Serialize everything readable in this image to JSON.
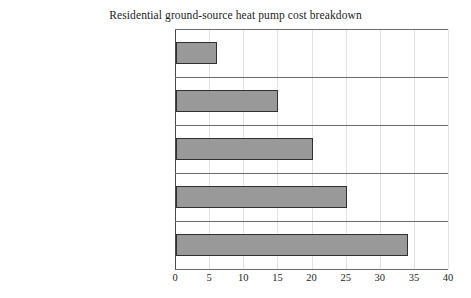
{
  "chart_data": {
    "type": "bar",
    "orientation": "horizontal",
    "title": "Residential ground-source heat pump cost breakdown",
    "xlabel": "",
    "ylabel": "",
    "categories": [
      "Brine pumps",
      "Ductwork",
      "Indoor installation",
      "Geothermal heat pumps",
      "Ground-coupled heat exchanger"
    ],
    "values": [
      6,
      15,
      20,
      25,
      34
    ],
    "xlim": [
      0,
      40
    ],
    "xticks": [
      0,
      5,
      10,
      15,
      20,
      25,
      30,
      35,
      40
    ],
    "xtick_labels": [
      "0",
      "5",
      "10",
      "15",
      "20",
      "25",
      "30",
      "35",
      "40"
    ],
    "grid": "vertical",
    "legend": null,
    "colors": {
      "bar_fill": "#999999",
      "bar_edge": "#303030",
      "gridline": "#e2e2e2",
      "frame": "#6a6a6a",
      "axis": "#4a4a4a",
      "text": "#1c1c1c",
      "background": "#ffffff"
    }
  }
}
